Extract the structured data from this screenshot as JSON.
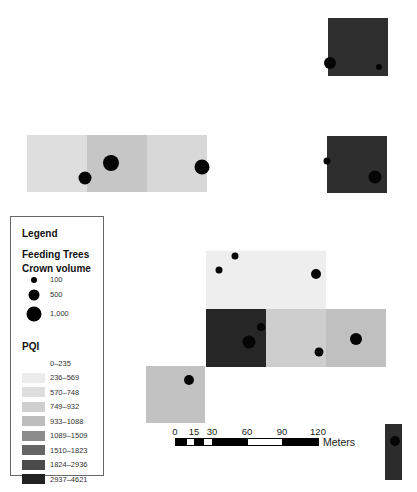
{
  "legend": {
    "title": "Legend",
    "layer": "Feeding Trees",
    "size_title": "Crown volume",
    "sizes": [
      {
        "label": "100",
        "d": 6
      },
      {
        "label": "500",
        "d": 11
      },
      {
        "label": "1,000",
        "d": 15
      }
    ],
    "pqi_title": "PQI",
    "classes": [
      {
        "label": "0–235",
        "color": "#ffffff"
      },
      {
        "label": "236–569",
        "color": "#ececec"
      },
      {
        "label": "570–748",
        "color": "#dedede"
      },
      {
        "label": "749–932",
        "color": "#cfcfcf"
      },
      {
        "label": "933–1088",
        "color": "#bdbdbd"
      },
      {
        "label": "1089–1509",
        "color": "#8c8c8c"
      },
      {
        "label": "1510–1823",
        "color": "#656565"
      },
      {
        "label": "1824–2936",
        "color": "#4a4a4a"
      },
      {
        "label": "2937–4621",
        "color": "#222222"
      }
    ]
  },
  "scalebar": {
    "ticks": [
      "0",
      "15",
      "30",
      "60",
      "90",
      "120"
    ],
    "unit": "Meters"
  },
  "cells": [
    {
      "x": 328,
      "y": 18,
      "w": 60,
      "h": 58,
      "color": "#2f2f2f"
    },
    {
      "x": 27,
      "y": 135,
      "w": 60,
      "h": 57,
      "color": "#dedede"
    },
    {
      "x": 87,
      "y": 135,
      "w": 60,
      "h": 57,
      "color": "#c6c6c6"
    },
    {
      "x": 147,
      "y": 135,
      "w": 60,
      "h": 57,
      "color": "#d8d8d8"
    },
    {
      "x": 327,
      "y": 136,
      "w": 60,
      "h": 57,
      "color": "#2e2e2e"
    },
    {
      "x": 206,
      "y": 251,
      "w": 120,
      "h": 58,
      "color": "#eeeeee"
    },
    {
      "x": 206,
      "y": 309,
      "w": 60,
      "h": 58,
      "color": "#262626"
    },
    {
      "x": 266,
      "y": 309,
      "w": 60,
      "h": 58,
      "color": "#cecece"
    },
    {
      "x": 326,
      "y": 309,
      "w": 60,
      "h": 58,
      "color": "#c0c0c0"
    },
    {
      "x": 146,
      "y": 366,
      "w": 59,
      "h": 57,
      "color": "#c2c2c2"
    },
    {
      "x": 385,
      "y": 424,
      "w": 17,
      "h": 56,
      "color": "#2c2c2c"
    }
  ],
  "trees": [
    {
      "x": 330,
      "y": 63,
      "d": 12
    },
    {
      "x": 379,
      "y": 67,
      "d": 6
    },
    {
      "x": 111,
      "y": 163,
      "d": 16
    },
    {
      "x": 85,
      "y": 178,
      "d": 13
    },
    {
      "x": 202,
      "y": 167,
      "d": 15
    },
    {
      "x": 327,
      "y": 161,
      "d": 7
    },
    {
      "x": 375,
      "y": 177,
      "d": 13
    },
    {
      "x": 235,
      "y": 256,
      "d": 7
    },
    {
      "x": 219,
      "y": 270,
      "d": 7
    },
    {
      "x": 316,
      "y": 274,
      "d": 10
    },
    {
      "x": 261,
      "y": 327,
      "d": 8
    },
    {
      "x": 249,
      "y": 342,
      "d": 13
    },
    {
      "x": 319,
      "y": 352,
      "d": 9
    },
    {
      "x": 356,
      "y": 339,
      "d": 12
    },
    {
      "x": 189,
      "y": 380,
      "d": 10
    },
    {
      "x": 395,
      "y": 441,
      "d": 10
    }
  ]
}
